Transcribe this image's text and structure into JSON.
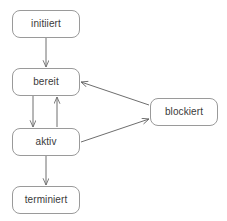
{
  "diagram": {
    "background_color": "#ffffff",
    "node_border_color": "#9a9a9a",
    "node_fill_color": "#ffffff",
    "edge_color": "#6e6e6e",
    "text_color": "#3a3a3a",
    "nodes": [
      {
        "id": "initiiert",
        "label": "initiiert",
        "x": 12,
        "y": 10,
        "w": 68,
        "h": 28
      },
      {
        "id": "bereit",
        "label": "bereit",
        "x": 12,
        "y": 68,
        "w": 68,
        "h": 28
      },
      {
        "id": "aktiv",
        "label": "aktiv",
        "x": 12,
        "y": 128,
        "w": 68,
        "h": 28
      },
      {
        "id": "terminiert",
        "label": "terminiert",
        "x": 12,
        "y": 186,
        "w": 68,
        "h": 28
      },
      {
        "id": "blockiert",
        "label": "blockiert",
        "x": 150,
        "y": 98,
        "w": 68,
        "h": 28
      }
    ],
    "edges": [
      {
        "id": "initiiert-to-bereit",
        "from": "initiiert",
        "to": "bereit",
        "label": ""
      },
      {
        "id": "bereit-to-aktiv",
        "from": "bereit",
        "to": "aktiv",
        "label": ""
      },
      {
        "id": "aktiv-to-bereit",
        "from": "aktiv",
        "to": "bereit",
        "label": ""
      },
      {
        "id": "aktiv-to-terminiert",
        "from": "aktiv",
        "to": "terminiert",
        "label": ""
      },
      {
        "id": "aktiv-to-blockiert",
        "from": "aktiv",
        "to": "blockiert",
        "label": ""
      },
      {
        "id": "blockiert-to-bereit",
        "from": "blockiert",
        "to": "bereit",
        "label": ""
      }
    ]
  }
}
